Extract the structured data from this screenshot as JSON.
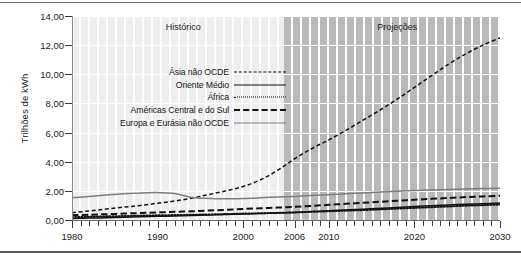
{
  "axes": {
    "ylabel": "Trilhões de kWh",
    "yticks": [
      "0,00",
      "2,00",
      "4,00",
      "6,00",
      "8,00",
      "10,00",
      "12,00",
      "14,00"
    ],
    "ytick_values": [
      0,
      2,
      4,
      6,
      8,
      10,
      12,
      14
    ],
    "xticks": [
      "1980",
      "1990",
      "2000",
      "2006",
      "2010",
      "2020",
      "2030"
    ],
    "xtick_values": [
      1980,
      1990,
      2000,
      2006,
      2010,
      2020,
      2030
    ],
    "xlim": [
      1980,
      2030
    ],
    "ylim": [
      0,
      14
    ]
  },
  "regions": [
    {
      "label": "Histórico",
      "start": 1980,
      "end": 2006,
      "center": 1993
    },
    {
      "label": "Projeções",
      "start": 2006,
      "end": 2030,
      "center": 2018
    }
  ],
  "legend": [
    {
      "label": "Ásia não OCDE",
      "style": "dashed",
      "color": "#111111"
    },
    {
      "label": "Oriente Médio",
      "style": "solid",
      "color": "#111111"
    },
    {
      "label": "África",
      "style": "dotted",
      "color": "#111111"
    },
    {
      "label": "Américas Central e do Sul",
      "style": "long-dashed",
      "color": "#111111"
    },
    {
      "label": "Europa e Eurásia não OCDE",
      "style": "solid",
      "color": "#7d7d7d"
    }
  ],
  "chart_data": {
    "type": "line",
    "title": "",
    "subtitle": "",
    "xlabel": "",
    "ylabel": "Trilhões de kWh",
    "xlim": [
      1980,
      2030
    ],
    "ylim": [
      0,
      14
    ],
    "grid": "horizontal-white-on-striped-bands",
    "legend_position": "inside-upper-left",
    "x": [
      1980,
      1982,
      1984,
      1986,
      1988,
      1990,
      1992,
      1994,
      1996,
      1998,
      2000,
      2002,
      2004,
      2006,
      2008,
      2010,
      2012,
      2014,
      2016,
      2018,
      2020,
      2022,
      2024,
      2026,
      2028,
      2030
    ],
    "series": [
      {
        "name": "Ásia não OCDE",
        "style": "dashed",
        "color": "#111111",
        "values": [
          0.5,
          0.62,
          0.75,
          0.88,
          1.0,
          1.15,
          1.3,
          1.5,
          1.75,
          2.0,
          2.3,
          2.75,
          3.4,
          4.2,
          4.9,
          5.5,
          6.15,
          6.85,
          7.55,
          8.3,
          9.1,
          9.9,
          10.7,
          11.4,
          12.0,
          12.5
        ]
      },
      {
        "name": "Oriente Médio",
        "style": "solid",
        "color": "#111111",
        "values": [
          0.1,
          0.13,
          0.16,
          0.19,
          0.22,
          0.25,
          0.28,
          0.31,
          0.34,
          0.38,
          0.42,
          0.45,
          0.48,
          0.52,
          0.58,
          0.63,
          0.69,
          0.74,
          0.8,
          0.86,
          0.92,
          0.98,
          1.03,
          1.08,
          1.12,
          1.16
        ]
      },
      {
        "name": "África",
        "style": "dotted",
        "color": "#111111",
        "values": [
          0.2,
          0.22,
          0.25,
          0.27,
          0.3,
          0.32,
          0.34,
          0.36,
          0.38,
          0.41,
          0.44,
          0.46,
          0.49,
          0.52,
          0.56,
          0.6,
          0.64,
          0.68,
          0.73,
          0.78,
          0.83,
          0.88,
          0.93,
          0.98,
          1.02,
          1.06
        ]
      },
      {
        "name": "Américas Central e do Sul",
        "style": "long-dashed",
        "color": "#111111",
        "values": [
          0.32,
          0.36,
          0.4,
          0.44,
          0.48,
          0.52,
          0.56,
          0.6,
          0.65,
          0.7,
          0.76,
          0.8,
          0.85,
          0.9,
          0.97,
          1.04,
          1.11,
          1.18,
          1.25,
          1.32,
          1.39,
          1.45,
          1.51,
          1.57,
          1.62,
          1.66
        ]
      },
      {
        "name": "Europa e Eurásia não OCDE",
        "style": "solid",
        "color": "#7d7d7d",
        "values": [
          1.52,
          1.62,
          1.72,
          1.8,
          1.86,
          1.88,
          1.82,
          1.55,
          1.48,
          1.45,
          1.47,
          1.52,
          1.58,
          1.62,
          1.68,
          1.74,
          1.8,
          1.86,
          1.92,
          1.98,
          2.02,
          2.06,
          2.1,
          2.13,
          2.16,
          2.18
        ]
      }
    ]
  }
}
